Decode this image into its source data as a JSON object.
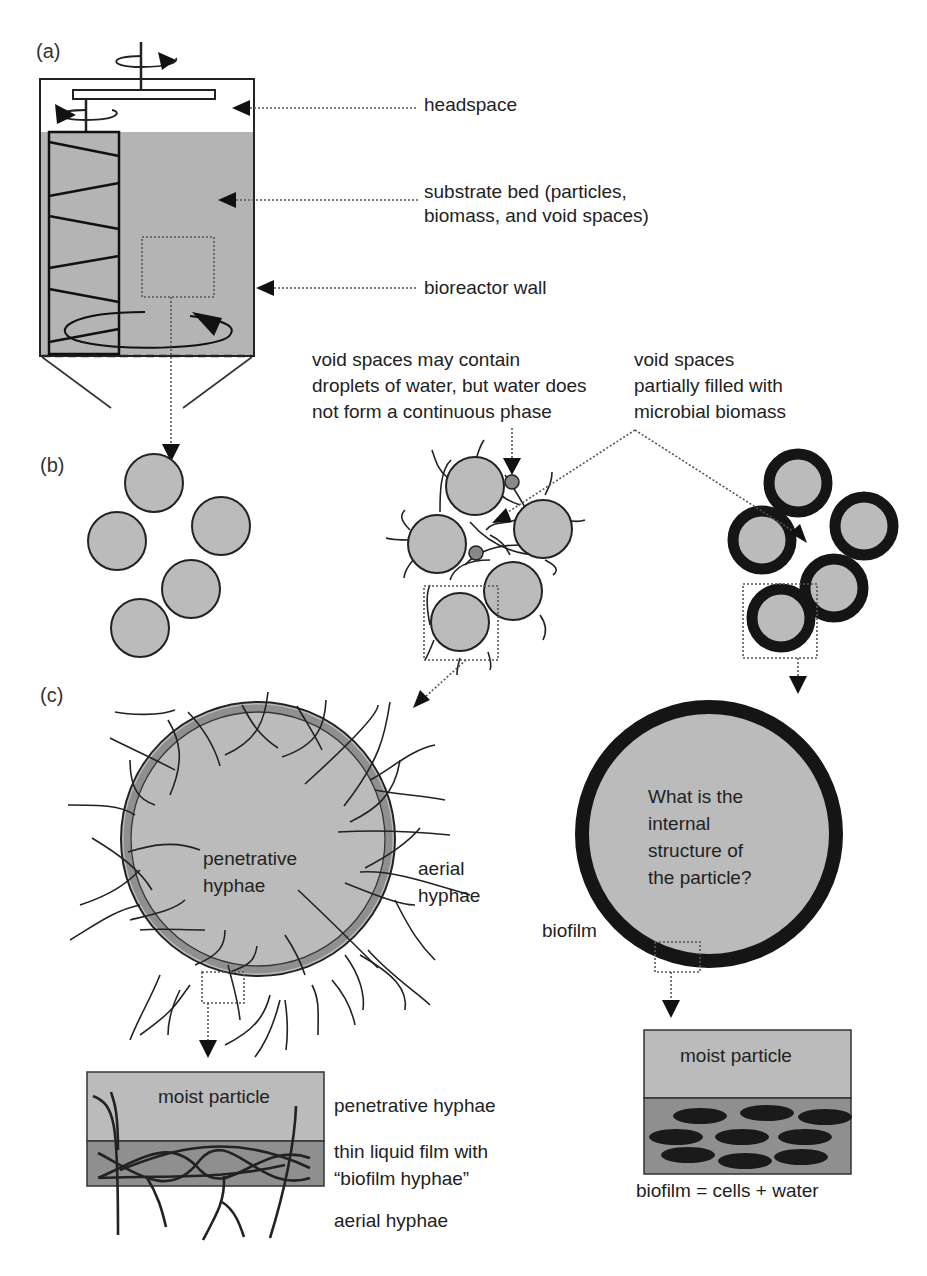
{
  "panels": {
    "a": "(a)",
    "b": "(b)",
    "c": "(c)"
  },
  "panel_a": {
    "labels": {
      "headspace": "headspace",
      "substrate_line1": "substrate bed (particles,",
      "substrate_line2": "biomass, and void spaces)",
      "wall": "bioreactor wall"
    }
  },
  "panel_b": {
    "droplets_note": {
      "line1": "void spaces may contain",
      "line2": "droplets of water, but water does",
      "line3": "not form a continuous phase"
    },
    "biomass_note": {
      "line1": "void spaces",
      "line2": "partially filled with",
      "line3": "microbial biomass"
    }
  },
  "panel_c": {
    "left": {
      "penetrative_line1": "penetrative",
      "penetrative_line2": "hyphae",
      "aerial_line1": "aerial",
      "aerial_line2": "hyphae",
      "detail": {
        "box_label": "moist particle",
        "penetrative": "penetrative hyphae",
        "film_line1": "thin liquid film with",
        "film_line2": "“biofilm hyphae”",
        "aerial": "aerial hyphae"
      }
    },
    "right": {
      "question_line1": "What is the",
      "question_line2": "internal",
      "question_line3": "structure of",
      "question_line4": "the particle?",
      "biofilm_label": "biofilm",
      "detail": {
        "box_label": "moist particle",
        "caption": "biofilm = cells + water"
      }
    }
  },
  "colors": {
    "particle_fill": "#bbbbbb",
    "bed_fill": "#b4b4b4",
    "film_fill": "#8f8f8f",
    "biofilm_ring": "#151515",
    "line": "#222222"
  }
}
